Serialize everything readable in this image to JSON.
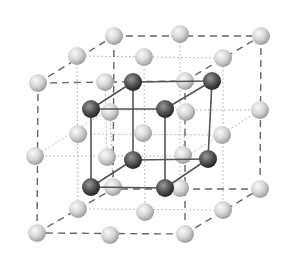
{
  "colors": {
    "light_atom_center": "#f4f4f4",
    "light_atom_edge": "#a9a9a9",
    "dark_atom_center": "#8a8a8a",
    "dark_atom_edge": "#2a2a2a",
    "dashed_line": "#666666",
    "dotted_line": "#aaaaaa",
    "solid_line": "#555555"
  },
  "outer_cube": {
    "style": "dashed",
    "front": [
      [
        38,
        83
      ],
      [
        185,
        81
      ],
      [
        185,
        234
      ],
      [
        37,
        233
      ]
    ],
    "back": [
      [
        114,
        36
      ],
      [
        261,
        36
      ],
      [
        260,
        189
      ],
      [
        113,
        189
      ]
    ]
  },
  "mid_lines": [
    [
      [
        77,
        56
      ],
      [
        223,
        58
      ]
    ],
    [
      [
        223,
        58
      ],
      [
        223,
        210
      ]
    ],
    [
      [
        223,
        210
      ],
      [
        78,
        209
      ]
    ],
    [
      [
        78,
        209
      ],
      [
        77,
        56
      ]
    ],
    [
      [
        35,
        156
      ],
      [
        108,
        110
      ]
    ],
    [
      [
        108,
        110
      ],
      [
        260,
        110
      ]
    ],
    [
      [
        260,
        110
      ],
      [
        187,
        156
      ]
    ],
    [
      [
        187,
        156
      ],
      [
        35,
        156
      ]
    ],
    [
      [
        110,
        112
      ],
      [
        113,
        187
      ]
    ],
    [
      [
        186,
        112
      ],
      [
        183,
        155
      ]
    ],
    [
      [
        144,
        57
      ],
      [
        145,
        212
      ]
    ],
    [
      [
        78,
        134
      ],
      [
        222,
        135
      ]
    ],
    [
      [
        105,
        82
      ],
      [
        107,
        157
      ]
    ],
    [
      [
        180,
        34
      ],
      [
        180,
        191
      ]
    ]
  ],
  "inner_cube": {
    "style": "solid",
    "front": [
      [
        91,
        109
      ],
      [
        165,
        109
      ],
      [
        165,
        188
      ],
      [
        91,
        187
      ]
    ],
    "back": [
      [
        133,
        82
      ],
      [
        212,
        81
      ],
      [
        208,
        159
      ],
      [
        133,
        160
      ]
    ]
  },
  "light_atoms": [
    [
      114,
      36
    ],
    [
      180,
      34
    ],
    [
      261,
      36
    ],
    [
      77,
      56
    ],
    [
      144,
      57
    ],
    [
      223,
      58
    ],
    [
      38,
      83
    ],
    [
      105,
      82
    ],
    [
      185,
      81
    ],
    [
      110,
      112
    ],
    [
      186,
      112
    ],
    [
      260,
      110
    ],
    [
      78,
      134
    ],
    [
      143,
      133
    ],
    [
      222,
      135
    ],
    [
      35,
      156
    ],
    [
      107,
      157
    ],
    [
      183,
      155
    ],
    [
      113,
      187
    ],
    [
      180,
      188
    ],
    [
      260,
      189
    ],
    [
      78,
      209
    ],
    [
      145,
      212
    ],
    [
      223,
      210
    ],
    [
      37,
      233
    ],
    [
      110,
      235
    ],
    [
      185,
      234
    ]
  ],
  "dark_atoms": [
    [
      133,
      82
    ],
    [
      212,
      81
    ],
    [
      91,
      109
    ],
    [
      165,
      109
    ],
    [
      133,
      160
    ],
    [
      208,
      159
    ],
    [
      91,
      187
    ],
    [
      165,
      188
    ]
  ],
  "atom_radius": 9
}
